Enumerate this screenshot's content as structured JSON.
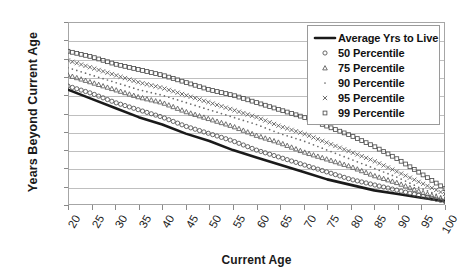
{
  "chart_data": {
    "type": "line",
    "title": "",
    "xlabel": "Current Age",
    "ylabel": "Years Beyond Current Age",
    "xlim": [
      20,
      100
    ],
    "ylim": [
      0,
      100
    ],
    "ytick_step": 10,
    "xtick_step": 5,
    "grid": "horizontal",
    "legend_position": "top-right",
    "x": [
      20,
      25,
      30,
      35,
      40,
      45,
      50,
      55,
      60,
      65,
      70,
      75,
      80,
      85,
      90,
      95,
      100
    ],
    "xticklabels": [
      "20",
      "25",
      "30",
      "35",
      "40",
      "45",
      "50",
      "55",
      "60",
      "65",
      "70",
      "75",
      "80",
      "85",
      "90",
      "95",
      "100"
    ],
    "yticklabels": [
      "0",
      "10",
      "20",
      "30",
      "40",
      "50",
      "60",
      "70",
      "80",
      "90",
      "100"
    ],
    "series": [
      {
        "name": "Average Yrs to Live",
        "marker": "line",
        "style": "solid-thick",
        "color": "#1a1a1a",
        "values": [
          63,
          58,
          53,
          48,
          44,
          39,
          35,
          30,
          26,
          22,
          18,
          14,
          11,
          8,
          6,
          4,
          2
        ]
      },
      {
        "name": "50 Percentile",
        "marker": "circle",
        "style": "dotted",
        "color": "#4d4d4d",
        "values": [
          65,
          61,
          56,
          52,
          48,
          43,
          39,
          35,
          30,
          26,
          22,
          18,
          14,
          11,
          8,
          5,
          2
        ]
      },
      {
        "name": "75 Percentile",
        "marker": "triangle",
        "style": "dotted",
        "color": "#5a5a5a",
        "values": [
          71,
          67,
          63,
          59,
          56,
          51,
          47,
          43,
          38,
          34,
          29,
          25,
          21,
          16,
          12,
          7,
          3
        ]
      },
      {
        "name": "90 Percentile",
        "marker": "dot",
        "style": "dotted",
        "color": "#6b6b6b",
        "values": [
          75,
          71,
          67,
          63,
          60,
          56,
          52,
          48,
          44,
          39,
          35,
          30,
          25,
          20,
          15,
          9,
          4
        ]
      },
      {
        "name": "95 Percentile",
        "marker": "cross",
        "style": "dotted",
        "color": "#555555",
        "values": [
          79,
          75,
          71,
          67,
          64,
          60,
          56,
          52,
          48,
          43,
          39,
          34,
          29,
          24,
          18,
          12,
          6
        ]
      },
      {
        "name": "99 Percentile",
        "marker": "square",
        "style": "dotted",
        "color": "#4f4f4f",
        "values": [
          84,
          81,
          77,
          74,
          71,
          67,
          63,
          60,
          56,
          52,
          48,
          43,
          38,
          32,
          25,
          17,
          9
        ]
      }
    ]
  },
  "legend": {
    "items": [
      {
        "label": "Average Yrs to Live",
        "key": "line"
      },
      {
        "label": "50 Percentile",
        "key": "circle"
      },
      {
        "label": "75 Percentile",
        "key": "triangle"
      },
      {
        "label": "90 Percentile",
        "key": "dot"
      },
      {
        "label": "95 Percentile",
        "key": "cross"
      },
      {
        "label": "99 Percentile",
        "key": "square"
      }
    ]
  }
}
